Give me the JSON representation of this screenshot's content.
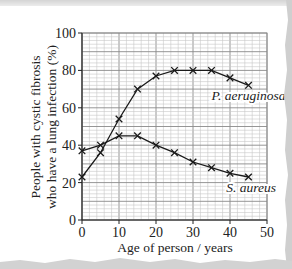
{
  "chart_data": {
    "type": "line",
    "title": "",
    "xlabel": "Age of person / years",
    "ylabel_lines": [
      "People with cystic fibrosis",
      "who have a lung infection (%)"
    ],
    "ylabel": "People with cystic fibrosis who have a lung infection (%)",
    "xlim": [
      0,
      50
    ],
    "ylim": [
      0,
      100
    ],
    "x_ticks": [
      0,
      10,
      20,
      30,
      40,
      50
    ],
    "y_ticks": [
      0,
      20,
      40,
      60,
      80,
      100
    ],
    "grid": {
      "on": true,
      "major_step": 10,
      "minor_step": 2
    },
    "marker": "x",
    "x": [
      0,
      5,
      10,
      15,
      20,
      25,
      30,
      35,
      40,
      45
    ],
    "series": [
      {
        "name": "P. aeruginosa",
        "values": [
          23,
          36,
          54,
          70,
          77,
          80,
          80,
          80,
          76,
          72
        ],
        "label_pos": [
          35,
          64
        ]
      },
      {
        "name": "S. aureus",
        "values": [
          37,
          40,
          45,
          45,
          40,
          36,
          31,
          28,
          25,
          23
        ],
        "label_pos": [
          39,
          15
        ]
      }
    ],
    "legend": "inline labels next to curves",
    "colors": {
      "line": "#1a1a1a",
      "grid_minor": "#c8c8c8",
      "grid_major": "#8a8a8a",
      "axis": "#222222"
    }
  },
  "labels": {
    "x_axis": "Age of person / years",
    "y_axis_line1": "People with cystic fibrosis",
    "y_axis_line2": "who have a lung infection (%)"
  }
}
